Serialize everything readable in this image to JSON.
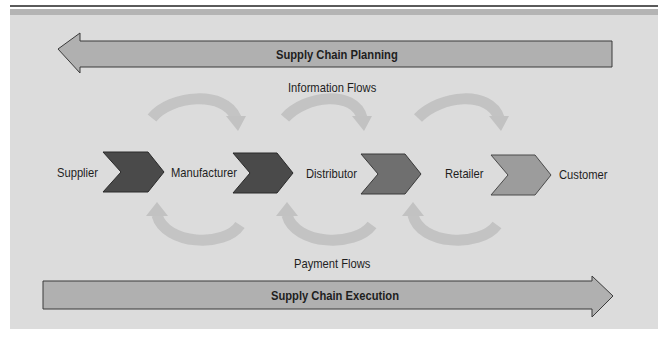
{
  "planning_arrow": {
    "label": "Supply Chain Planning",
    "direction": "left"
  },
  "execution_arrow": {
    "label": "Supply Chain Execution",
    "direction": "right"
  },
  "information_flows_label": "Information Flows",
  "payment_flows_label": "Payment Flows",
  "nodes": [
    {
      "label": "Supplier"
    },
    {
      "label": "Manufacturer"
    },
    {
      "label": "Distributor"
    },
    {
      "label": "Retailer"
    },
    {
      "label": "Customer"
    }
  ],
  "chevrons": [
    {
      "from": "Supplier",
      "to": "Manufacturer",
      "color": "#4a4a4a"
    },
    {
      "from": "Manufacturer",
      "to": "Distributor",
      "color": "#4a4a4a"
    },
    {
      "from": "Distributor",
      "to": "Retailer",
      "color": "#6f6f6f"
    },
    {
      "from": "Retailer",
      "to": "Customer",
      "color": "#9c9c9c"
    }
  ],
  "colors": {
    "panel": "#dcdcdc",
    "arrow_fill": "#b0b0b0",
    "flow_arrows": "#c2c2c2",
    "outline": "#3a3a3a"
  }
}
